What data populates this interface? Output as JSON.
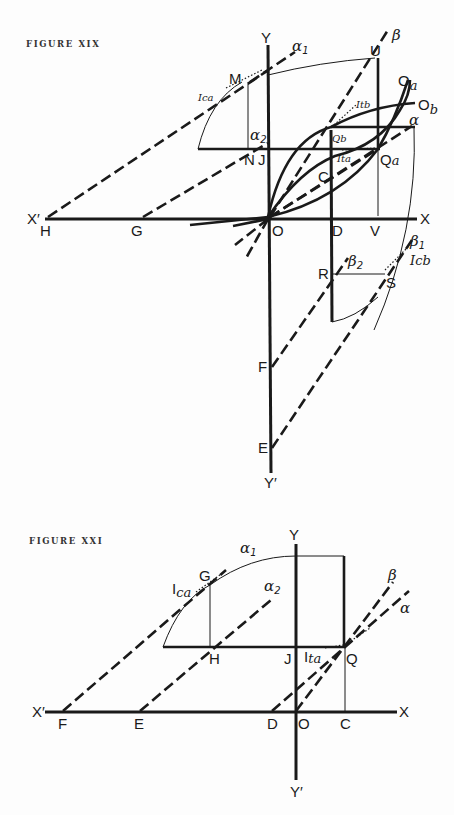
{
  "figures": [
    {
      "caption": "FIGURE XIX",
      "labels": {
        "Y": "Y",
        "Yp": "Y′",
        "X": "X",
        "Xp": "X′",
        "O": "O",
        "H": "H",
        "G": "G",
        "D": "D",
        "V": "V",
        "M": "M",
        "N": "N",
        "J": "J",
        "U": "U",
        "C": "C",
        "R": "R",
        "S": "S",
        "F": "F",
        "E": "E",
        "Qa_main": "Q",
        "Qa_sub": "a",
        "Qb": "Qb",
        "Oa_main": "O",
        "Oa_sub": "a",
        "Ob_main": "O",
        "Ob_sub": "b",
        "alpha": "α",
        "alpha1": "α",
        "alpha1_sub": "1",
        "alpha2": "α",
        "alpha2_sub": "2",
        "beta": "β",
        "beta1": "β",
        "beta1_sub": "1",
        "beta2": "β",
        "beta2_sub": "2",
        "Ica": "Ica",
        "Itb": "Itb",
        "Ita": "Ita",
        "Icb": "Icb"
      }
    },
    {
      "caption": "FIGURE XXI",
      "labels": {
        "Y": "Y",
        "Yp": "Y′",
        "X": "X",
        "Xp": "X′",
        "O": "O",
        "F": "F",
        "E": "E",
        "D": "D",
        "C": "C",
        "G": "G",
        "H": "H",
        "J": "J",
        "Q": "Q",
        "alpha": "α",
        "alpha1": "α",
        "alpha1_sub": "1",
        "alpha2": "α",
        "alpha2_sub": "2",
        "beta": "β",
        "Ica_main": "I",
        "Ica_sub": "ca",
        "Ita_main": "I",
        "Ita_sub": "ta"
      }
    }
  ]
}
